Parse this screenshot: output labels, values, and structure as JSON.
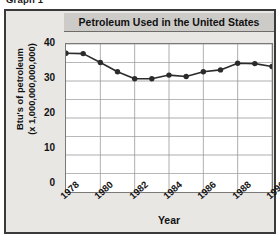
{
  "figure": {
    "caption": "Graph 1"
  },
  "chart_data": {
    "type": "line",
    "title": "Petroleum Used in the United States",
    "xlabel": "Year",
    "ylabel_line1": "Btu's of petroleum",
    "ylabel_line2": "(x 1,000,000,000,000)",
    "x": [
      1978,
      1979,
      1980,
      1981,
      1982,
      1983,
      1984,
      1985,
      1986,
      1987,
      1988,
      1989,
      1990
    ],
    "values": [
      37.5,
      37.4,
      35.0,
      32.5,
      30.6,
      30.6,
      31.6,
      31.2,
      32.5,
      33.0,
      34.8,
      34.7,
      33.9
    ],
    "xlim": [
      1978,
      1990
    ],
    "ylim": [
      0,
      40
    ],
    "xtick_labels": [
      "1978",
      "1980",
      "1982",
      "1984",
      "1986",
      "1988",
      "1990"
    ],
    "xtick_values": [
      1978,
      1980,
      1982,
      1984,
      1986,
      1988,
      1990
    ],
    "ytick_labels": [
      "40",
      "30",
      "20",
      "10",
      "0"
    ],
    "ytick_values": [
      40,
      30,
      20,
      10,
      0
    ],
    "grid": true,
    "legend": null,
    "marker": "filled-circle",
    "series_color": "#2b2b2b",
    "grid_color": "#9a9a9a",
    "plot_background": "#ffffff",
    "panel_background": "#e9e7e4",
    "title_background": "#cdcbc8"
  }
}
